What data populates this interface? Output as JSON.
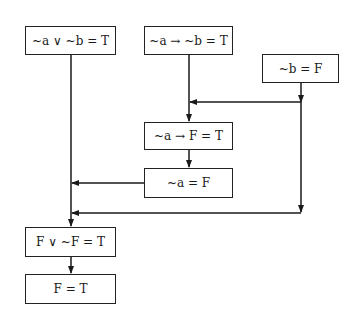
{
  "diagram": {
    "type": "flowchart",
    "nodes": [
      {
        "id": "n1",
        "label": "~a ∨ ~b = T",
        "x": 25,
        "y": 26,
        "w": 91,
        "h": 29
      },
      {
        "id": "n2",
        "label": "~a → ~b = T",
        "x": 144,
        "y": 26,
        "w": 89,
        "h": 29
      },
      {
        "id": "n3",
        "label": "~b = F",
        "x": 262,
        "y": 54,
        "w": 77,
        "h": 29
      },
      {
        "id": "n4",
        "label": "~a → F = T",
        "x": 144,
        "y": 122,
        "w": 89,
        "h": 28
      },
      {
        "id": "n5",
        "label": "~a = F",
        "x": 144,
        "y": 168,
        "w": 89,
        "h": 30
      },
      {
        "id": "n6",
        "label": "F ∨ ~F = T",
        "x": 25,
        "y": 227,
        "w": 91,
        "h": 30
      },
      {
        "id": "n7",
        "label": "F = T",
        "x": 25,
        "y": 274,
        "w": 91,
        "h": 30
      }
    ],
    "edges": [
      {
        "from": "n2",
        "to": "n4"
      },
      {
        "from": "n3",
        "to": "n4",
        "via": "branch right-to-left at y=102"
      },
      {
        "from": "n4",
        "to": "n5"
      },
      {
        "from": "n5",
        "to": "n6",
        "via": "left branch at y=183"
      },
      {
        "from": "n3",
        "to": "n6",
        "via": "branch at y=213"
      },
      {
        "from": "n1",
        "to": "n6"
      },
      {
        "from": "n6",
        "to": "n7"
      }
    ]
  },
  "colors": {
    "line": "#1a1a1a",
    "background": "#ffffff"
  }
}
